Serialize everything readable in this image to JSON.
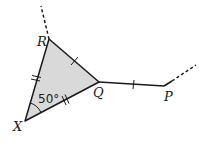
{
  "diagram": {
    "type": "geometry",
    "points": {
      "R": {
        "label": "R",
        "x": 49,
        "y": 39
      },
      "Q": {
        "label": "Q",
        "x": 99,
        "y": 82
      },
      "X": {
        "label": "X",
        "x": 25,
        "y": 121
      },
      "P": {
        "label": "P",
        "x": 164,
        "y": 86
      }
    },
    "triangle": {
      "vertices": [
        "R",
        "Q",
        "X"
      ],
      "fill": "#d9d9d9",
      "stroke": "#1a1a1a"
    },
    "angle_label": "50°",
    "angle_at": "X",
    "segments": [
      {
        "from": "X",
        "to": "R",
        "tick_marks": 2
      },
      {
        "from": "X",
        "to": "Q",
        "tick_marks": 2
      },
      {
        "from": "R",
        "to": "Q",
        "tick_marks": 1
      },
      {
        "from": "Q",
        "to": "P",
        "tick_marks": 1
      }
    ],
    "dashed_extensions": [
      {
        "from": "R",
        "direction": "up"
      },
      {
        "from": "P",
        "direction": "up-right"
      }
    ]
  }
}
